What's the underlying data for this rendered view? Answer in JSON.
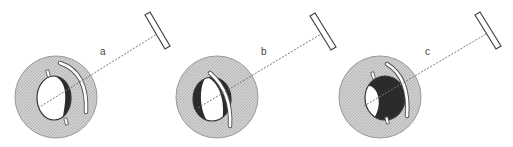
{
  "figure": {
    "panels": [
      {
        "label": "a",
        "state": "mostly-white-ball-dark-right"
      },
      {
        "label": "b",
        "state": "white-ball-dark-rim"
      },
      {
        "label": "c",
        "state": "mostly-dark-ball-white-left"
      }
    ]
  },
  "colors": {
    "outer_disc": "#c9c9c9",
    "outer_disc_stroke": "#8a8a8a",
    "dark": "#2b2b2b",
    "light": "#ffffff",
    "beam": "#777777",
    "mirror_stroke": "#444444"
  }
}
